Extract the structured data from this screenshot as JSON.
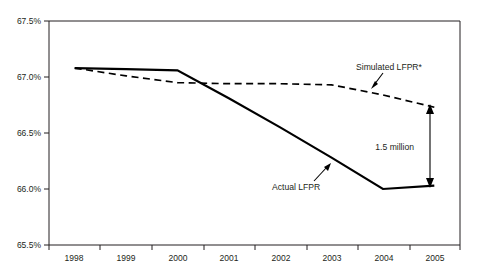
{
  "chart_data": {
    "type": "line",
    "title": "",
    "xlabel": "",
    "ylabel": "",
    "x": [
      1998,
      1999,
      2000,
      2001,
      2002,
      2003,
      2004,
      2005
    ],
    "categories": [
      "1998",
      "1999",
      "2000",
      "2001",
      "2002",
      "2003",
      "2004",
      "2005"
    ],
    "ylim": [
      65.5,
      67.5
    ],
    "xlim": [
      1997.5,
      2005.5
    ],
    "ytick_labels": [
      "67.5%",
      "67.0%",
      "66.5%",
      "66.0%",
      "65.5%"
    ],
    "ytick_values": [
      67.5,
      67.0,
      66.5,
      66.0,
      65.5
    ],
    "xtick_labels": [
      "1998",
      "1999",
      "2000",
      "2001",
      "2002",
      "2003",
      "2004",
      "2005"
    ],
    "grid": false,
    "legend": "annotations-inline",
    "series": [
      {
        "name": "Actual LFPR",
        "style": "solid",
        "color": "#000000",
        "values": [
          67.08,
          67.07,
          67.06,
          66.81,
          66.55,
          66.28,
          66.0,
          66.03
        ]
      },
      {
        "name": "Simulated LFPR*",
        "style": "dashed",
        "color": "#000000",
        "values": [
          67.08,
          67.01,
          66.95,
          66.94,
          66.94,
          66.93,
          66.84,
          66.73
        ]
      }
    ],
    "annotations": [
      {
        "id": "simulated-label",
        "text": "Simulated LFPR*",
        "x_px": 356,
        "y_px": 67,
        "arrow_from": [
          383,
          71
        ],
        "arrow_to": [
          372,
          86
        ]
      },
      {
        "id": "actual-label",
        "text": "Actual LFPR",
        "x_px": 272,
        "y_px": 187,
        "arrow_from": [
          317,
          180
        ],
        "arrow_to": [
          331,
          163
        ]
      },
      {
        "id": "gap-label",
        "text": "1.5 million",
        "x_px": 414,
        "y_px": 147,
        "arrow_top": [
          430,
          106
        ],
        "arrow_bottom": [
          430,
          186
        ]
      }
    ]
  },
  "axis": {
    "frame_color": "#231f20"
  }
}
